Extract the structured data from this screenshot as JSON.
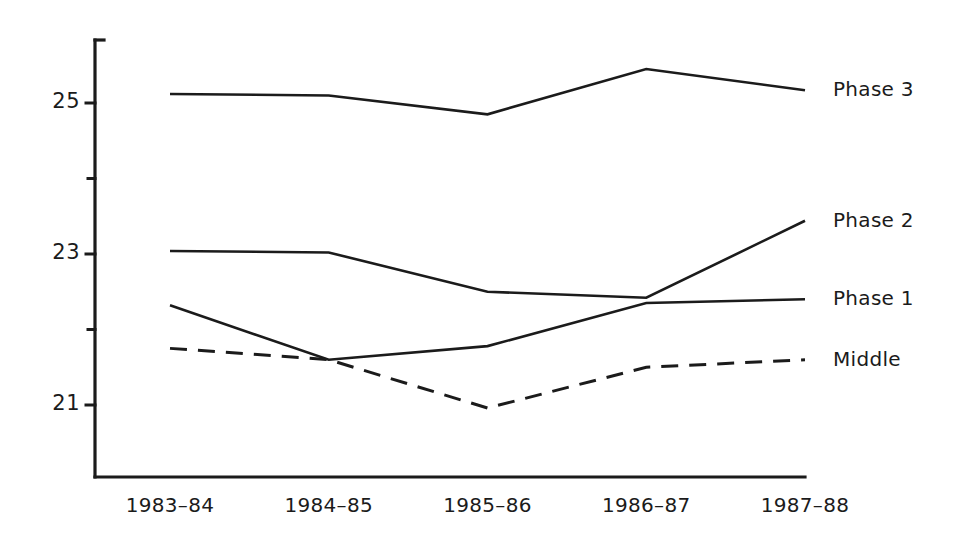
{
  "chart_data": {
    "type": "line",
    "title": "",
    "subtitle": "",
    "xlabel": "",
    "ylabel": "",
    "categories": [
      "1983–84",
      "1984–85",
      "1985–86",
      "1986–87",
      "1987–88"
    ],
    "y_tick_labels": [
      "21",
      "23",
      "25"
    ],
    "y_ticks_all": [
      21,
      22,
      23,
      24,
      25
    ],
    "ylim": [
      20.2,
      25.9
    ],
    "grid": false,
    "legend_position": "right-inline",
    "line_color": "#1b1b1b",
    "background_color": "#ffffff",
    "series": [
      {
        "name": "Phase 3",
        "style": "solid",
        "values": [
          25.12,
          25.1,
          24.85,
          25.45,
          25.17
        ]
      },
      {
        "name": "Phase 2",
        "style": "solid",
        "values": [
          23.04,
          23.02,
          22.5,
          22.42,
          23.44
        ]
      },
      {
        "name": "Phase 1",
        "style": "solid",
        "values": [
          22.32,
          21.6,
          21.78,
          22.35,
          22.4
        ]
      },
      {
        "name": "Middle",
        "style": "dashed",
        "values": [
          21.75,
          21.6,
          20.96,
          21.5,
          21.6
        ]
      }
    ]
  },
  "axes": {
    "y_axis_name": "y-axis",
    "x_axis_name": "x-axis"
  }
}
